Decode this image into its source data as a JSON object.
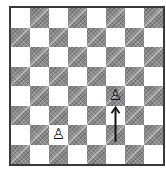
{
  "board": {
    "orientation": "white-bottom",
    "files": [
      "a",
      "b",
      "c",
      "d",
      "e",
      "f",
      "g",
      "h"
    ],
    "ranks": [
      8,
      7,
      6,
      5,
      4,
      3,
      2,
      1
    ],
    "colors": {
      "light": "#ffffff",
      "dark": "#8a8a8a",
      "border": "#3a3a3a"
    }
  },
  "pieces": [
    {
      "square": "f4",
      "type": "pawn",
      "color": "white",
      "glyph": "♙"
    },
    {
      "square": "c2",
      "type": "pawn",
      "color": "white",
      "glyph": "♙"
    }
  ],
  "arrows": [
    {
      "from": "f2",
      "to": "f3",
      "label": "pawn move direction",
      "color": "#111111"
    }
  ]
}
